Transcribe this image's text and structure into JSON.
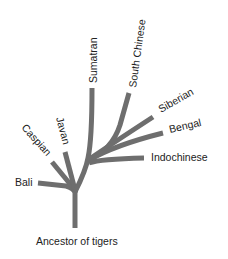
{
  "diagram": {
    "type": "phylogenetic-tree",
    "branch_color": "#6e6e6e",
    "label_color": "#222222",
    "root": {
      "label": "Ancestor of tigers"
    },
    "leaves": [
      {
        "label": "Bali"
      },
      {
        "label": "Caspian"
      },
      {
        "label": "Javan"
      },
      {
        "label": "Sumatran"
      },
      {
        "label": "South Chinese"
      },
      {
        "label": "Siberian"
      },
      {
        "label": "Bengal"
      },
      {
        "label": "Indochinese"
      }
    ]
  }
}
